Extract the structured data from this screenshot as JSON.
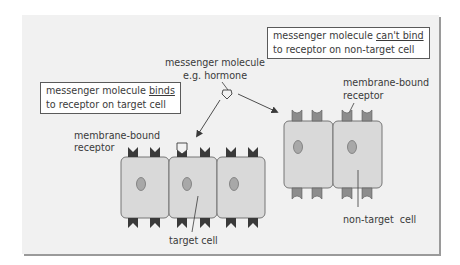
{
  "diagram": {
    "labels": {
      "binds_box": {
        "line1_prefix": "messenger molecule ",
        "line1_emph": "binds",
        "line2": "to receptor on target cell"
      },
      "cant_bind_box": {
        "line1_prefix": "messenger molecule ",
        "line1_emph": "can't bind",
        "line2": "to receptor on non-target cell"
      },
      "messenger": {
        "line1": "messenger molecule",
        "line2": "e.g. hormone"
      },
      "receptor_left": {
        "line1": "membrane-bound",
        "line2": "receptor"
      },
      "receptor_right": {
        "line1": "membrane-bound",
        "line2": "receptor"
      },
      "target_cell": "target cell",
      "non_target_cell": "non-target  cell"
    },
    "groups": {
      "target": {
        "cell_count": 3,
        "receptor_shape": "v-notch",
        "bound_receptor_index": 2
      },
      "non_target": {
        "cell_count": 2,
        "receptor_shape": "round-notch"
      }
    },
    "colors": {
      "panel_bg": "#f1f1f1",
      "panel_shadow": "#9a9a9a",
      "cell_fill": "#d9d9d9",
      "cell_stroke": "#6a6a6a",
      "nucleus_fill": "#a8a8a8",
      "target_receptor": "#3a3a3a",
      "non_target_receptor": "#8c8c8c",
      "hormone_fill": "#f2f2f2",
      "text": "#3a3a3a"
    }
  }
}
